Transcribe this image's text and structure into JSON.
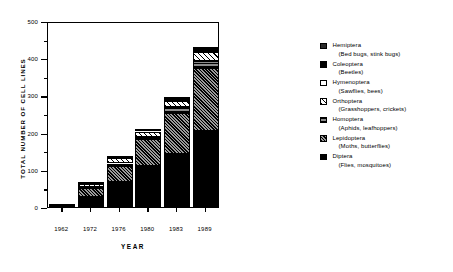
{
  "chart_data": {
    "type": "bar",
    "subtype": "stacked",
    "title": "",
    "xlabel": "YEAR",
    "ylabel": "TOTAL NUMBER OF CELL LINES",
    "categories": [
      "1962",
      "1972",
      "1976",
      "1980",
      "1983",
      "1989"
    ],
    "ylim": [
      0,
      500
    ],
    "yticks": [
      0,
      100,
      200,
      300,
      400,
      500
    ],
    "ytick_labels": [
      "0",
      "100",
      "200",
      "300",
      "400",
      "500"
    ],
    "yminor_ticks": [
      50,
      150,
      250,
      350,
      450
    ],
    "grid": false,
    "legend_position": "right",
    "series": [
      {
        "name": "Diptera",
        "values": [
          4,
          28,
          68,
          110,
          142,
          205
        ]
      },
      {
        "name": "Lepidoptera",
        "values": [
          1,
          22,
          42,
          72,
          112,
          168
        ]
      },
      {
        "name": "Homoptera",
        "values": [
          0,
          4,
          7,
          7,
          14,
          19
        ]
      },
      {
        "name": "Orthoptera",
        "values": [
          0,
          8,
          16,
          14,
          18,
          26
        ]
      },
      {
        "name": "Hymenoptera",
        "values": [
          0,
          1,
          1,
          2,
          3,
          4
        ]
      },
      {
        "name": "Coleoptera",
        "values": [
          0,
          0,
          0,
          0,
          1,
          2
        ]
      },
      {
        "name": "Hemiptera",
        "values": [
          0,
          0,
          0,
          0,
          1,
          1
        ]
      }
    ],
    "totals": [
      5,
      63,
      134,
      205,
      291,
      425
    ]
  },
  "legend": {
    "items": [
      {
        "name": "Hemiptera",
        "common": "(Bed bugs, stink bugs)",
        "swatch": "hemiptera"
      },
      {
        "name": "Coleoptera",
        "common": "(Beetles)",
        "swatch": "coleoptera"
      },
      {
        "name": "Hymenoptera",
        "common": "(Sawflies, bees)",
        "swatch": "hymenoptera"
      },
      {
        "name": "Orthoptera",
        "common": "(Grasshoppers, crickets)",
        "swatch": "orthoptera"
      },
      {
        "name": "Homoptera",
        "common": "(Aphids, leafhoppers)",
        "swatch": "homoptera"
      },
      {
        "name": "Lepidoptera",
        "common": "(Moths, butterflies)",
        "swatch": "lepidoptera"
      },
      {
        "name": "Diptera",
        "common": "(Flies, mosquitoes)",
        "swatch": "diptera"
      }
    ]
  }
}
